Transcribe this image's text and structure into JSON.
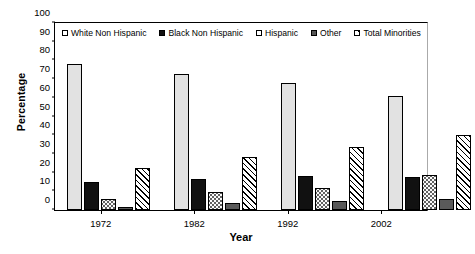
{
  "chart_data": {
    "type": "bar",
    "title": "",
    "xlabel": "Year",
    "ylabel": "Percentage",
    "categories": [
      "1972",
      "1982",
      "1992",
      "2002"
    ],
    "ylim": [
      0,
      100
    ],
    "yticks": [
      0,
      10,
      20,
      30,
      40,
      50,
      60,
      70,
      80,
      90,
      100
    ],
    "grid": false,
    "legend_position": "top-inside",
    "series": [
      {
        "name": "White Non Hispanic",
        "swatch": "light-gray-solid",
        "values": [
          78,
          73,
          68,
          61
        ]
      },
      {
        "name": "Black Non Hispanic",
        "swatch": "black-solid",
        "values": [
          15,
          16.5,
          18,
          17.5
        ]
      },
      {
        "name": "Hispanic",
        "swatch": "white-dotted",
        "values": [
          6,
          9.5,
          12,
          18.5
        ]
      },
      {
        "name": "Other",
        "swatch": "dark-gray-solid",
        "values": [
          1.5,
          3.5,
          5,
          6
        ]
      },
      {
        "name": "Total Minorities",
        "swatch": "diagonal-hatch",
        "values": [
          22.5,
          28.5,
          33.5,
          40
        ]
      }
    ]
  },
  "colors": {
    "white_non_hispanic": "#e2e2e2",
    "black_non_hispanic": "#111111",
    "hispanic": "#fafafa",
    "other": "#5a5a5a",
    "total_minorities": "#ffffff",
    "axis": "#000000"
  }
}
